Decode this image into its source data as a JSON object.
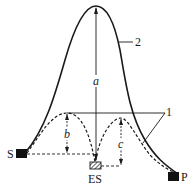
{
  "diagram": {
    "type": "reaction energy profile (catalyzed vs uncatalyzed)",
    "curves": [
      {
        "id": "2",
        "style": "solid",
        "description": "uncatalyzed reaction pathway, single high barrier"
      },
      {
        "id": "1",
        "style": "dashed",
        "description": "enzyme-catalyzed pathway, two lower barriers via ES intermediate"
      }
    ],
    "labels": {
      "substrate": "S",
      "product": "P",
      "intermediate": "ES",
      "curve_uncatalyzed": "2",
      "curve_catalyzed": "1",
      "barrier_a": "a",
      "barrier_b": "b",
      "barrier_c": "c"
    },
    "colors": {
      "line": "#1a1a1a",
      "background": "#ffffff"
    }
  }
}
